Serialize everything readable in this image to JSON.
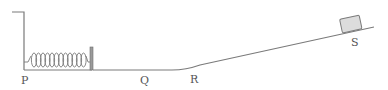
{
  "diagram": {
    "type": "physics-track",
    "labels": {
      "p": "P",
      "q": "Q",
      "r": "R",
      "s": "S"
    },
    "components": {
      "wall": "vertical wall with top ledge",
      "spring": "coil spring, 12 coils",
      "plate": "gray plate at end of spring",
      "track_flat": "horizontal segment P to Q",
      "track_curve": "smooth curve from Q to R",
      "track_incline": "straight incline R to S",
      "block": "gray block on incline at S"
    },
    "colors": {
      "line": "#7a7a7a",
      "block_fill": "#dcdcdc",
      "plate_fill": "#9a9a9a",
      "label": "#555555"
    }
  }
}
